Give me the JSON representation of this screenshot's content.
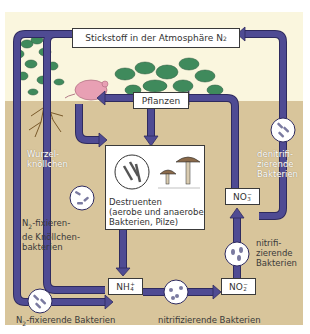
{
  "title": {
    "text": "Stickstoff in der Atmosphäre N",
    "subscript": "2"
  },
  "boxes": {
    "plants": "Pflanzen",
    "decomposers": {
      "line1": "Destruenten",
      "line2": "(aerobe und anaerobe",
      "line3": "Bakterien, Pilze)"
    },
    "ammonium": {
      "base": "NH",
      "sub": "4",
      "sup": "+"
    },
    "nitrite": {
      "base": "NO",
      "sub": "2",
      "sup": "−"
    },
    "nitrate": {
      "base": "NO",
      "sub": "3",
      "sup": "−"
    }
  },
  "labels": {
    "root_nodules": {
      "line1": "Wurzel-",
      "line2": "knöllchen"
    },
    "nodule_bacteria": {
      "line1_pre": "N",
      "line1_sub": "2",
      "line1_post": "-fixieren-",
      "line2": "de Knöllchen-",
      "line3": "bakterien"
    },
    "n2_fixing_bacteria": {
      "pre": "N",
      "sub": "2",
      "post": "-fixierende Bakterien"
    },
    "nitrifying_bottom": "nitrifizierende Bakterien",
    "nitrifying_right": {
      "line1": "nitrifi-",
      "line2": "zierende",
      "line3": "Bakterien"
    },
    "denitrifying": {
      "line1": "denitrifi-",
      "line2": "zierende",
      "line3": "Bakterien"
    }
  },
  "colors": {
    "arrow": "#4f4b93",
    "arrow_outline": "#2e2a5e",
    "sky": "#faf6de",
    "soil": "#d8c59b",
    "plant": "#3f8a5c",
    "animal": "#e8a0b4"
  }
}
